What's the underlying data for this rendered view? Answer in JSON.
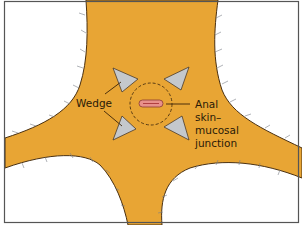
{
  "diagram": {
    "title": "",
    "labels": {
      "wedge": "Wedge",
      "junction_line1": "Anal",
      "junction_line2": "skin–",
      "junction_line3": "mucosal",
      "junction_line4": "junction"
    },
    "colors": {
      "skin": "#e8a534",
      "skin_outline": "#4a3010",
      "background": "#ffffff",
      "frame": "#555555",
      "wedge_fill": "#c4c8cc",
      "wedge_stroke": "#4a3a2a",
      "anal_opening_outer": "#e8908a",
      "anal_opening_inner": "#b04040",
      "dashed_circle": "#4a3010",
      "leader_line": "#3a2208",
      "hair": "#7a7f88"
    },
    "elements": [
      {
        "type": "body-shape",
        "description": "X-shaped skin region (perianal area between buttocks)"
      },
      {
        "type": "wedge",
        "position": "upper-left"
      },
      {
        "type": "wedge",
        "position": "upper-right"
      },
      {
        "type": "wedge",
        "position": "lower-left"
      },
      {
        "type": "wedge",
        "position": "lower-right"
      },
      {
        "type": "dashed-circle",
        "description": "excision margin around anal opening"
      },
      {
        "type": "anal-opening",
        "description": "elongated pink oval at center"
      }
    ]
  }
}
